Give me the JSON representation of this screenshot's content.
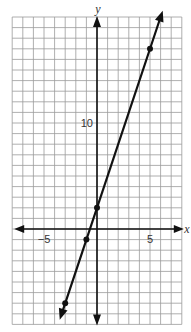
{
  "chart_data": {
    "type": "line",
    "title": "",
    "xlabel": "x",
    "ylabel": "y",
    "xlim": [
      -8,
      8
    ],
    "ylim": [
      -9,
      20
    ],
    "grid": true,
    "tick_labels": {
      "x": [
        {
          "value": -5,
          "label": "−5"
        },
        {
          "value": 5,
          "label": "5"
        }
      ],
      "y": [
        {
          "value": 10,
          "label": "10"
        }
      ]
    },
    "series": [
      {
        "name": "y = 3x + 2",
        "equation": "y = 3x + 2",
        "slope": 3,
        "intercept": 2,
        "points": [
          {
            "x": -3,
            "y": -7
          },
          {
            "x": -1,
            "y": -1
          },
          {
            "x": 0,
            "y": 2
          },
          {
            "x": 5,
            "y": 17
          }
        ],
        "arrows_both_ends": true
      }
    ]
  },
  "labels": {
    "x_axis": "x",
    "y_axis": "y",
    "x_neg5": "−5",
    "x_pos5": "5",
    "y_10": "10"
  },
  "layout": {
    "origin_px": [
      97,
      229
    ],
    "unit_px": 10.6
  }
}
